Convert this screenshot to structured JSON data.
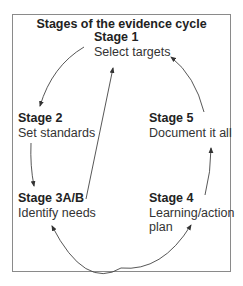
{
  "diagram": {
    "title": "Stages of the evidence cycle",
    "stages": [
      {
        "id": "stage-1",
        "name": "Stage 1",
        "description": "Select targets"
      },
      {
        "id": "stage-2",
        "name": "Stage 2",
        "description": "Set standards"
      },
      {
        "id": "stage-3",
        "name": "Stage 3A/B",
        "description": "Identify needs"
      },
      {
        "id": "stage-4",
        "name": "Stage 4",
        "description_lines": [
          "Learning/action",
          "plan"
        ]
      },
      {
        "id": "stage-5",
        "name": "Stage 5",
        "description": "Document it all"
      }
    ],
    "edges": [
      {
        "from": "Stage 1",
        "to": "Stage 2",
        "style": "curved-arrow"
      },
      {
        "from": "Stage 2",
        "to": "Stage 3A/B",
        "style": "arrow"
      },
      {
        "from": "Stage 3A/B",
        "to": "Stage 1",
        "style": "straight-arrow"
      },
      {
        "from": "Stage 3A/B",
        "to": "Stage 4",
        "style": "curved-double-arrow"
      },
      {
        "from": "Stage 4",
        "to": "Stage 5",
        "style": "arrow"
      },
      {
        "from": "Stage 5",
        "to": "Stage 1",
        "style": "curved-arrow"
      }
    ],
    "colors": {
      "border": "#8a8a8a",
      "text": "#222222",
      "arrow": "#444444"
    }
  }
}
